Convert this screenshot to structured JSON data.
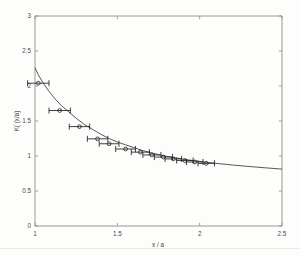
{
  "chart_data": {
    "type": "scatter",
    "title": "",
    "subtitle": "",
    "xlabel": "x / a",
    "ylabel": "K( (x/a)",
    "xlim": [
      1,
      2.5
    ],
    "ylim": [
      0,
      3
    ],
    "xticks": [
      1,
      1.5,
      2,
      2.5
    ],
    "xticklabels": [
      "1",
      "1.5",
      "2",
      "2.5"
    ],
    "yticks": [
      0,
      0.5,
      1,
      1.5,
      2,
      2.5,
      3
    ],
    "yticklabels": [
      "0",
      "0.5",
      "1",
      "1.5",
      "2",
      "2.5",
      "3"
    ],
    "grid": false,
    "legend": null,
    "series": [
      {
        "name": "fit curve",
        "type": "line",
        "x": [
          1.0,
          1.02,
          1.05,
          1.08,
          1.12,
          1.16,
          1.2,
          1.25,
          1.3,
          1.35,
          1.4,
          1.45,
          1.5,
          1.55,
          1.6,
          1.65,
          1.7,
          1.75,
          1.8,
          1.85,
          1.9,
          1.95,
          2.0,
          2.05,
          2.1,
          2.2,
          2.3,
          2.4,
          2.5
        ],
        "y": [
          2.26,
          2.16,
          2.04,
          1.94,
          1.82,
          1.72,
          1.64,
          1.54,
          1.45,
          1.38,
          1.31,
          1.25,
          1.2,
          1.16,
          1.12,
          1.08,
          1.05,
          1.02,
          0.995,
          0.975,
          0.955,
          0.938,
          0.922,
          0.908,
          0.895,
          0.871,
          0.85,
          0.831,
          0.813
        ]
      },
      {
        "name": "measured data",
        "type": "scatter",
        "marker": "circle",
        "xerr_style": "horizontal-capped",
        "points": [
          {
            "x": 1.02,
            "y": 2.04,
            "xerr": 0.065
          },
          {
            "x": 1.15,
            "y": 1.65,
            "xerr": 0.065
          },
          {
            "x": 1.27,
            "y": 1.42,
            "xerr": 0.062
          },
          {
            "x": 1.38,
            "y": 1.245,
            "xerr": 0.062
          },
          {
            "x": 1.45,
            "y": 1.175,
            "xerr": 0.06
          },
          {
            "x": 1.55,
            "y": 1.1,
            "xerr": 0.06
          },
          {
            "x": 1.64,
            "y": 1.055,
            "xerr": 0.055
          },
          {
            "x": 1.71,
            "y": 1.015,
            "xerr": 0.055
          },
          {
            "x": 1.78,
            "y": 0.985,
            "xerr": 0.055
          },
          {
            "x": 1.84,
            "y": 0.958,
            "xerr": 0.05
          },
          {
            "x": 1.91,
            "y": 0.935,
            "xerr": 0.05
          },
          {
            "x": 1.97,
            "y": 0.915,
            "xerr": 0.05
          },
          {
            "x": 2.04,
            "y": 0.895,
            "xerr": 0.05
          }
        ]
      }
    ]
  }
}
